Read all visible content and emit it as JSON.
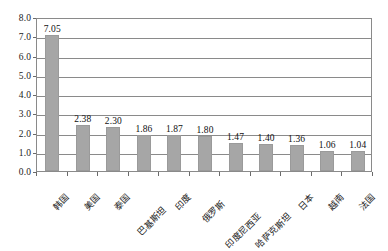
{
  "chart_data": {
    "type": "bar",
    "title": "",
    "subtitle": "",
    "xlabel": "",
    "ylabel": "",
    "ylim": [
      0.0,
      8.0
    ],
    "ytick_step": 1.0,
    "grid": true,
    "legend": false,
    "bar_color": "#a6a6a6",
    "plot_background": "#ffffff",
    "axis_color": "#8a8a8a",
    "categories": [
      "韩国",
      "美国",
      "泰国",
      "巴基斯坦",
      "印度",
      "俄罗斯",
      "印度尼西亚",
      "哈萨克斯坦",
      "日本",
      "越南",
      "法国"
    ],
    "values": [
      7.05,
      2.38,
      2.3,
      1.86,
      1.87,
      1.8,
      1.47,
      1.4,
      1.36,
      1.06,
      1.04
    ],
    "value_labels": [
      "7.05",
      "2.38",
      "2.30",
      "1.86",
      "1.87",
      "1.80",
      "1.47",
      "1.40",
      "1.36",
      "1.06",
      "1.04"
    ],
    "ytick_labels": [
      "0.0",
      "1.0",
      "2.0",
      "3.0",
      "4.0",
      "5.0",
      "6.0",
      "7.0",
      "8.0"
    ],
    "ytick_values": [
      0.0,
      1.0,
      2.0,
      3.0,
      4.0,
      5.0,
      6.0,
      7.0,
      8.0
    ]
  }
}
